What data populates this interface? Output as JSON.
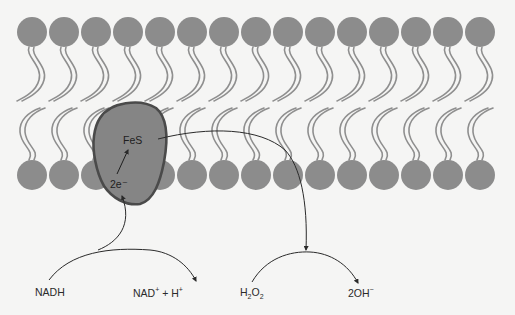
{
  "diagram": {
    "title": "",
    "membrane": {
      "head_count": 15,
      "head_spacing": 32,
      "first_head_x": 32,
      "top_row_y": 32,
      "bottom_row_y": 175,
      "head_radius": 15,
      "head_color": "#8c8c8c",
      "tail_color": "#8f8f8f"
    },
    "protein": {
      "fill": "#858585",
      "stroke": "#4a4a4a",
      "center_label": "FeS",
      "electron_label": "2e⁻"
    },
    "reactions": {
      "left": {
        "substrate": "NADH",
        "product_main": "NAD",
        "product_main_sup": "+",
        "product_plus": " + H",
        "product_plus_sup": "+"
      },
      "right": {
        "substrate_h": "H",
        "substrate_sub1": "2",
        "substrate_o": "O",
        "substrate_sub2": "2",
        "product": "2OH",
        "product_sup": "−"
      }
    },
    "colors": {
      "background": "#f5f5f4",
      "arrow": "#2a2a2a"
    }
  }
}
